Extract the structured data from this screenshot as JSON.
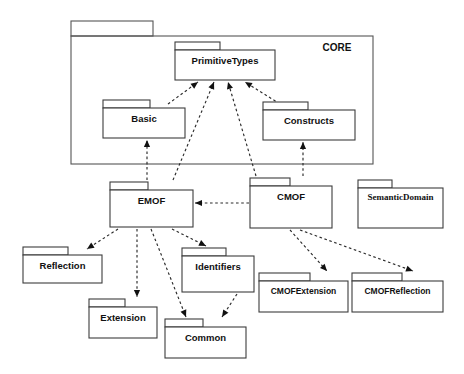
{
  "diagram": {
    "type": "uml-package-diagram",
    "colors": {
      "background": "#ffffff",
      "package_stroke": "#3c3c3c",
      "outer_stroke": "#555555",
      "line": "#2b2b2b",
      "text": "#111111"
    },
    "outer_package": {
      "name": "CORE",
      "label": "CORE",
      "x": 71,
      "y": 21,
      "width": 302,
      "height": 143,
      "tab_width": 82,
      "tab_height": 15,
      "label_x": 337,
      "label_y": 48
    },
    "packages": [
      {
        "id": "primitivetypes",
        "label": "PrimitiveTypes",
        "x": 175,
        "y": 42,
        "width": 100,
        "height": 38,
        "tab_width": 45,
        "tab_height": 8,
        "font": "sans"
      },
      {
        "id": "basic",
        "label": "Basic",
        "x": 103,
        "y": 100,
        "width": 82,
        "height": 38,
        "tab_width": 47,
        "tab_height": 8,
        "font": "sans"
      },
      {
        "id": "constructs",
        "label": "Constructs",
        "x": 263,
        "y": 102,
        "width": 92,
        "height": 38,
        "tab_width": 45,
        "tab_height": 8,
        "font": "sans"
      },
      {
        "id": "emof",
        "label": "EMOF",
        "x": 110,
        "y": 182,
        "width": 83,
        "height": 45,
        "tab_width": 38,
        "tab_height": 8,
        "font": "sans"
      },
      {
        "id": "cmof",
        "label": "CMOF",
        "x": 250,
        "y": 178,
        "width": 82,
        "height": 50,
        "tab_width": 40,
        "tab_height": 8,
        "font": "sans"
      },
      {
        "id": "semanticdomain",
        "label": "SemanticDomain",
        "x": 358,
        "y": 180,
        "width": 85,
        "height": 48,
        "tab_width": 34,
        "tab_height": 8,
        "font": "serif"
      },
      {
        "id": "reflection",
        "label": "Reflection",
        "x": 23,
        "y": 247,
        "width": 79,
        "height": 36,
        "tab_width": 45,
        "tab_height": 8,
        "font": "sans"
      },
      {
        "id": "identifiers",
        "label": "Identifiers",
        "x": 182,
        "y": 248,
        "width": 72,
        "height": 44,
        "tab_width": 44,
        "tab_height": 8,
        "font": "sans"
      },
      {
        "id": "cmofextension",
        "label": "CMOFExtension",
        "x": 259,
        "y": 273,
        "width": 89,
        "height": 39,
        "tab_width": 51,
        "tab_height": 8,
        "font": "sans-small"
      },
      {
        "id": "cmofreflection",
        "label": "CMOFReflection",
        "x": 352,
        "y": 273,
        "width": 91,
        "height": 39,
        "tab_width": 50,
        "tab_height": 8,
        "font": "sans-small"
      },
      {
        "id": "extension",
        "label": "Extension",
        "x": 89,
        "y": 299,
        "width": 68,
        "height": 39,
        "tab_width": 36,
        "tab_height": 8,
        "font": "sans"
      },
      {
        "id": "common",
        "label": "Common",
        "x": 165,
        "y": 319,
        "width": 81,
        "height": 39,
        "tab_width": 38,
        "tab_height": 8,
        "font": "sans"
      }
    ],
    "dependencies": [
      {
        "id": "basic-to-primitivetypes",
        "from": "Basic",
        "to": "PrimitiveTypes",
        "x1": 168,
        "y1": 104,
        "x2": 198,
        "y2": 82,
        "angle": 215
      },
      {
        "id": "emof-to-primitivetypes",
        "from": "EMOF",
        "to": "PrimitiveTypes",
        "x1": 173,
        "y1": 180,
        "x2": 214,
        "y2": 82,
        "angle": 203
      },
      {
        "id": "cmof-to-primitivetypes",
        "from": "CMOF",
        "to": "PrimitiveTypes",
        "x1": 256,
        "y1": 176,
        "x2": 228,
        "y2": 82,
        "angle": 163
      },
      {
        "id": "constructs-to-primitivetypes",
        "from": "Constructs",
        "to": "PrimitiveTypes",
        "x1": 280,
        "y1": 104,
        "x2": 245,
        "y2": 82,
        "angle": 148
      },
      {
        "id": "emof-to-basic",
        "from": "EMOF",
        "to": "Basic",
        "x1": 147,
        "y1": 180,
        "x2": 147,
        "y2": 140,
        "angle": 180
      },
      {
        "id": "cmof-to-constructs",
        "from": "CMOF",
        "to": "Constructs",
        "x1": 303,
        "y1": 176,
        "x2": 303,
        "y2": 142,
        "angle": 180
      },
      {
        "id": "cmof-to-emof",
        "from": "CMOF",
        "to": "EMOF",
        "x1": 249,
        "y1": 203,
        "x2": 195,
        "y2": 203,
        "angle": 270
      },
      {
        "id": "emof-to-reflection",
        "from": "EMOF",
        "to": "Reflection",
        "x1": 118,
        "y1": 229,
        "x2": 87,
        "y2": 249,
        "angle": 33
      },
      {
        "id": "emof-to-extension",
        "from": "EMOF",
        "to": "Extension",
        "x1": 137,
        "y1": 229,
        "x2": 137,
        "y2": 297,
        "angle": 0
      },
      {
        "id": "emof-to-common",
        "from": "EMOF",
        "to": "Common",
        "x1": 151,
        "y1": 229,
        "x2": 186,
        "y2": 317,
        "angle": -22
      },
      {
        "id": "emof-to-identifiers",
        "from": "EMOF",
        "to": "Identifiers",
        "x1": 172,
        "y1": 229,
        "x2": 206,
        "y2": 246,
        "angle": -26
      },
      {
        "id": "identifiers-to-common",
        "from": "Identifiers",
        "to": "Common",
        "x1": 237,
        "y1": 294,
        "x2": 222,
        "y2": 317,
        "angle": 24
      },
      {
        "id": "cmof-to-cmofextension",
        "from": "CMOF",
        "to": "CMOFExtension",
        "x1": 290,
        "y1": 230,
        "x2": 327,
        "y2": 271,
        "angle": -32
      },
      {
        "id": "cmof-to-cmofreflection",
        "from": "CMOF",
        "to": "CMOFReflection",
        "x1": 300,
        "y1": 230,
        "x2": 413,
        "y2": 271,
        "angle": -60
      }
    ]
  }
}
